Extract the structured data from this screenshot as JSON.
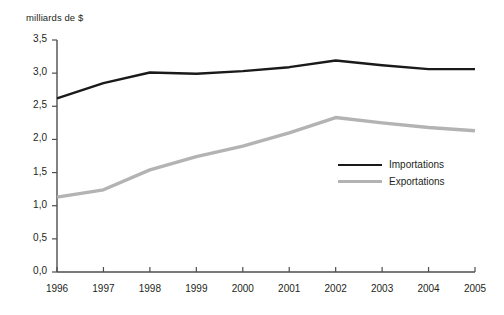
{
  "chart_data": {
    "type": "line",
    "title": "",
    "subtitle": "",
    "xlabel": "",
    "ylabel": "milliards de $",
    "categories": [
      "1996",
      "1997",
      "1998",
      "1999",
      "2000",
      "2001",
      "2002",
      "2003",
      "2004",
      "2005"
    ],
    "x": [
      1996,
      1997,
      1998,
      1999,
      2000,
      2001,
      2002,
      2003,
      2004,
      2005
    ],
    "series": [
      {
        "name": "Importations",
        "color": "#1a1a1a",
        "values": [
          2.62,
          2.85,
          3.01,
          2.99,
          3.03,
          3.09,
          3.19,
          3.12,
          3.06,
          3.06
        ]
      },
      {
        "name": "Exportations",
        "color": "#b3b3b3",
        "values": [
          1.13,
          1.24,
          1.54,
          1.74,
          1.9,
          2.1,
          2.33,
          2.25,
          2.18,
          2.13
        ]
      }
    ],
    "ylim": [
      0.0,
      3.5
    ],
    "ytick_labels": [
      "0,0",
      "0,5",
      "1,0",
      "1,5",
      "2,0",
      "2,5",
      "3,0",
      "3,5"
    ],
    "ytick_values": [
      0.0,
      0.5,
      1.0,
      1.5,
      2.0,
      2.5,
      3.0,
      3.5
    ],
    "grid": false,
    "legend_position": "center-right",
    "decimal_separator": ","
  },
  "legend": {
    "items": [
      {
        "label": "Importations",
        "swatch": "black-line-swatch"
      },
      {
        "label": "Exportations",
        "swatch": "gray-line-swatch"
      }
    ]
  }
}
